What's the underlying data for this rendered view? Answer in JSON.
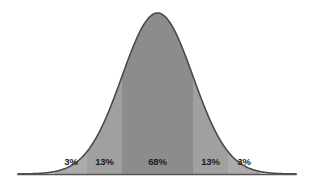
{
  "chart_data": {
    "type": "area",
    "title": "",
    "subtitle": "",
    "xlabel": "",
    "ylabel": "",
    "grid": false,
    "legend": "none",
    "categories": [
      "-3 to -2 SD",
      "-2 to -1 SD",
      "-1 to +1 SD",
      "+1 to +2 SD",
      "+2 to +3 SD"
    ],
    "values": [
      3,
      13,
      68,
      13,
      3
    ],
    "value_unit": "%",
    "bands": [
      {
        "label": "3%",
        "value": 3,
        "x_start": 55,
        "x_end": 87,
        "fill": "#ababab",
        "label_x": 71
      },
      {
        "label": "13%",
        "value": 13,
        "x_start": 87,
        "x_end": 122,
        "fill": "#a0a0a0",
        "label_x": 104.5
      },
      {
        "label": "68%",
        "value": 68,
        "x_start": 122,
        "x_end": 193,
        "fill": "#8c8c8c",
        "label_x": 157.5
      },
      {
        "label": "13%",
        "value": 13,
        "x_start": 193,
        "x_end": 228,
        "fill": "#a0a0a0",
        "label_x": 210.5
      },
      {
        "label": "3%",
        "value": 3,
        "x_start": 228,
        "x_end": 260,
        "fill": "#ababab",
        "label_x": 244
      }
    ],
    "tail_fill": "#e2e2e2",
    "curve_stroke": "#4a4a4a",
    "axis_stroke": "#555555",
    "label_color": "#1c1c1c",
    "background": "#ffffff",
    "peak_x": 157.5,
    "peak_y": 13,
    "baseline_y": 174,
    "axis_x_start": 18,
    "axis_x_end": 296,
    "labels_y": 157
  }
}
